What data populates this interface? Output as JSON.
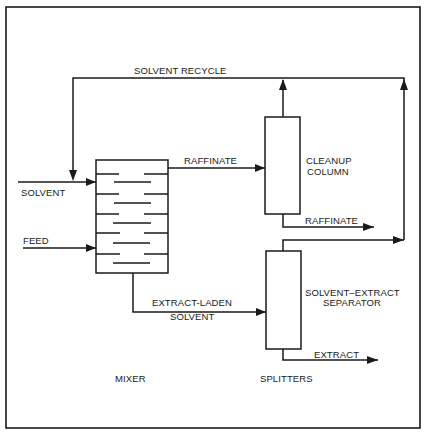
{
  "diagram": {
    "type": "process-flow",
    "colors": {
      "line": "#1a1a1a",
      "background": "#ffffff"
    },
    "units": {
      "mixer": {
        "label": "MIXER",
        "trays": 9
      },
      "cleanup_column": {
        "label_line1": "CLEANUP",
        "label_line2": "COLUMN"
      },
      "separator": {
        "label_line1": "SOLVENT–EXTRACT",
        "label_line2": "SEPARATOR"
      },
      "splitters_label": "SPLITTERS"
    },
    "streams": {
      "solvent_recycle": "SOLVENT RECYCLE",
      "solvent_in": "SOLVENT",
      "feed_in": "FEED",
      "raffinate_to_column": "RAFFINATE",
      "raffinate_out": "RAFFINATE",
      "extract_laden_line1": "EXTRACT-LADEN",
      "extract_laden_line2": "SOLVENT",
      "extract_out": "EXTRACT"
    }
  }
}
